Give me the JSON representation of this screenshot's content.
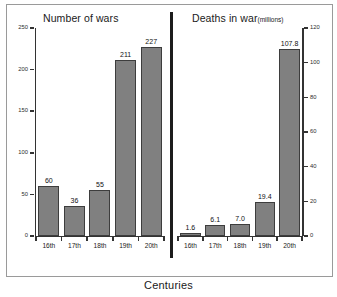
{
  "figure": {
    "x_axis_label": "Centuries",
    "bar_color": "#808080",
    "bar_edge_color": "#3d3d3d",
    "axis_color": "#333333",
    "background": "#ffffff"
  },
  "panels": {
    "wars": {
      "title": "Number of wars",
      "unit": "",
      "axis_side": "left",
      "y_ticks": [
        "0",
        "50",
        "100",
        "150",
        "200",
        "250"
      ],
      "categories": [
        "16th",
        "17th",
        "18th",
        "19th",
        "20th"
      ],
      "values": [
        "60",
        "36",
        "55",
        "211",
        "227"
      ]
    },
    "deaths": {
      "title": "Deaths in war",
      "unit": "(millions)",
      "axis_side": "right",
      "y_ticks": [
        "0",
        "20",
        "40",
        "60",
        "80",
        "100",
        "120"
      ],
      "categories": [
        "16th",
        "17th",
        "18th",
        "19th",
        "20th"
      ],
      "values": [
        "1.6",
        "6.1",
        "7.0",
        "19.4",
        "107.8"
      ]
    }
  },
  "chart_data": [
    {
      "type": "bar",
      "title": "Number of wars",
      "xlabel": "Centuries",
      "ylabel": "",
      "categories": [
        "16th",
        "17th",
        "18th",
        "19th",
        "20th"
      ],
      "values": [
        60,
        36,
        55,
        211,
        227
      ],
      "ylim": [
        0,
        250
      ],
      "yticks": [
        0,
        50,
        100,
        150,
        200,
        250
      ],
      "axis_position": "left",
      "grid": false,
      "legend": "none",
      "data_labels": true
    },
    {
      "type": "bar",
      "title": "Deaths in war (millions)",
      "xlabel": "Centuries",
      "ylabel": "millions",
      "categories": [
        "16th",
        "17th",
        "18th",
        "19th",
        "20th"
      ],
      "values": [
        1.6,
        6.1,
        7.0,
        19.4,
        107.8
      ],
      "ylim": [
        0,
        120
      ],
      "yticks": [
        0,
        20,
        40,
        60,
        80,
        100,
        120
      ],
      "axis_position": "right",
      "grid": false,
      "legend": "none",
      "data_labels": true
    }
  ]
}
